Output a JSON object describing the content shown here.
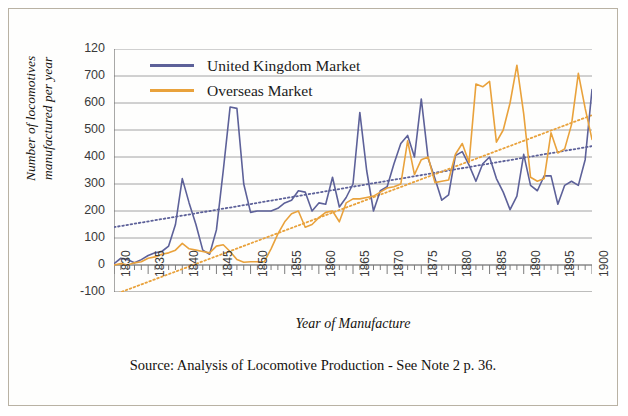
{
  "figure": {
    "caption": "Source: Analysis of Locomotive Production - See Note 2 p. 36.",
    "border_color": "#b9b2a4",
    "background": "#fefefd"
  },
  "legend": {
    "position": "top-left-inside",
    "items": [
      {
        "label": "United Kingdom Market",
        "color": "#5d6199",
        "icon": "line-swatch"
      },
      {
        "label": "Overseas Market",
        "color": "#e9a23c",
        "icon": "line-swatch"
      }
    ]
  },
  "chart_data": {
    "type": "line",
    "title": "",
    "subtitle": "",
    "xlabel": "Year of Manufacture",
    "ylabel": "Number of locomotives manufactured per year",
    "ylabel_lines": [
      "Number of locomotives",
      "manufactured per year"
    ],
    "xlim": [
      1830,
      1900
    ],
    "ylim": [
      -100,
      800
    ],
    "grid": true,
    "grid_axis": "y",
    "grid_color": "#9a9a9a",
    "yticks": [
      -100,
      0,
      100,
      200,
      300,
      400,
      500,
      600,
      700,
      800
    ],
    "ytick_labels": [
      "-100",
      "0",
      "100",
      "200",
      "300",
      "400",
      "500",
      "600",
      "700",
      "120"
    ],
    "xticks": [
      1830,
      1835,
      1840,
      1845,
      1850,
      1855,
      1860,
      1865,
      1870,
      1875,
      1880,
      1885,
      1890,
      1895,
      1900
    ],
    "xtick_labels": [
      "1830",
      "1835",
      "1840",
      "1845",
      "1850",
      "1855",
      "1860",
      "1865",
      "1870",
      "1875",
      "1880",
      "1885",
      "1890",
      "1895",
      "1900"
    ],
    "xtick_minor_step": 1,
    "x": [
      1830,
      1831,
      1832,
      1833,
      1834,
      1835,
      1836,
      1837,
      1838,
      1839,
      1840,
      1841,
      1842,
      1843,
      1844,
      1845,
      1846,
      1847,
      1848,
      1849,
      1850,
      1851,
      1852,
      1853,
      1854,
      1855,
      1856,
      1857,
      1858,
      1859,
      1860,
      1861,
      1862,
      1863,
      1864,
      1865,
      1866,
      1867,
      1868,
      1869,
      1870,
      1871,
      1872,
      1873,
      1874,
      1875,
      1876,
      1877,
      1878,
      1879,
      1880,
      1881,
      1882,
      1883,
      1884,
      1885,
      1886,
      1887,
      1888,
      1889,
      1890,
      1891,
      1892,
      1893,
      1894,
      1895,
      1896,
      1897,
      1898,
      1899,
      1900
    ],
    "series": [
      {
        "name": "United Kingdom Market",
        "color": "#5d6199",
        "style": "solid",
        "values": [
          5,
          25,
          20,
          8,
          20,
          35,
          45,
          50,
          70,
          150,
          320,
          230,
          150,
          55,
          40,
          130,
          350,
          585,
          580,
          300,
          195,
          200,
          200,
          200,
          210,
          230,
          240,
          275,
          270,
          200,
          230,
          225,
          325,
          215,
          250,
          300,
          565,
          350,
          200,
          275,
          290,
          375,
          450,
          480,
          400,
          615,
          395,
          320,
          240,
          260,
          405,
          420,
          370,
          310,
          375,
          400,
          320,
          270,
          205,
          255,
          410,
          295,
          275,
          330,
          330,
          225,
          295,
          310,
          295,
          390,
          650
        ]
      },
      {
        "name": "Overseas Market",
        "color": "#e9a23c",
        "style": "solid",
        "values": [
          0,
          5,
          0,
          8,
          12,
          25,
          30,
          40,
          45,
          55,
          80,
          60,
          55,
          50,
          45,
          70,
          75,
          50,
          20,
          10,
          12,
          12,
          12,
          60,
          115,
          160,
          190,
          200,
          140,
          150,
          175,
          195,
          200,
          160,
          230,
          245,
          245,
          250,
          255,
          270,
          285,
          290,
          300,
          460,
          335,
          390,
          400,
          305,
          310,
          315,
          410,
          450,
          380,
          670,
          660,
          680,
          455,
          500,
          600,
          740,
          560,
          325,
          310,
          320,
          490,
          415,
          430,
          520,
          710,
          580,
          465
        ]
      }
    ],
    "trendlines": [
      {
        "name": "United Kingdom Market trend",
        "color": "#5d6199",
        "style": "dotted",
        "from": {
          "x": 1830,
          "y": 140
        },
        "to": {
          "x": 1900,
          "y": 440
        }
      },
      {
        "name": "Overseas Market trend",
        "color": "#e9a23c",
        "style": "dotted",
        "from": {
          "x": 1830,
          "y": -110
        },
        "to": {
          "x": 1900,
          "y": 555
        }
      }
    ]
  }
}
